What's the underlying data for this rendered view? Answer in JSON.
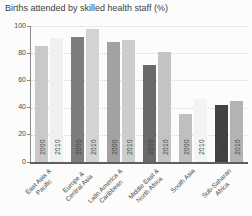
{
  "title": "Births attended by skilled health staff (%)",
  "chart_data": {
    "type": "bar",
    "title": "Births attended by skilled health staff (%)",
    "categories": [
      "East Asia &\nPacific",
      "Europe &\nCentral Asia",
      "Latin America &\nCaribbean",
      "Middle East &\nNorth Africa",
      "South Asia",
      "Sub-Saharan\nAfrica"
    ],
    "series": [
      {
        "name": "2000",
        "values": [
          85,
          92,
          88,
          71,
          35,
          42
        ],
        "colors": [
          "#c9c9c9",
          "#7d7d7d",
          "#a2a2a2",
          "#6a6a6a",
          "#bfbfbf",
          "#424242"
        ]
      },
      {
        "name": "2010",
        "values": [
          91,
          98,
          90,
          81,
          46,
          45
        ],
        "colors": [
          "#f0f0f0",
          "#d3d3d3",
          "#cdcdcd",
          "#c3c3c3",
          "#f3f3f3",
          "#b3b3b3"
        ]
      }
    ],
    "xlabel": "",
    "ylabel": "",
    "ylim": [
      0,
      100
    ],
    "yticks": [
      0,
      20,
      40,
      60,
      80,
      100
    ],
    "grid": true,
    "legend": "none",
    "bar_year_labels_rotated": true
  },
  "colors": {
    "background": "#fcfcfc",
    "title_text": "#3f3f3f",
    "tick_text": "#4a4a4a",
    "label_text": "#3f3f3f",
    "year_label_text": "#3d3d3d",
    "axis_line": "#8a8a8a",
    "baseline": "#5f5f5f",
    "gridline": "#d6d6d6"
  }
}
